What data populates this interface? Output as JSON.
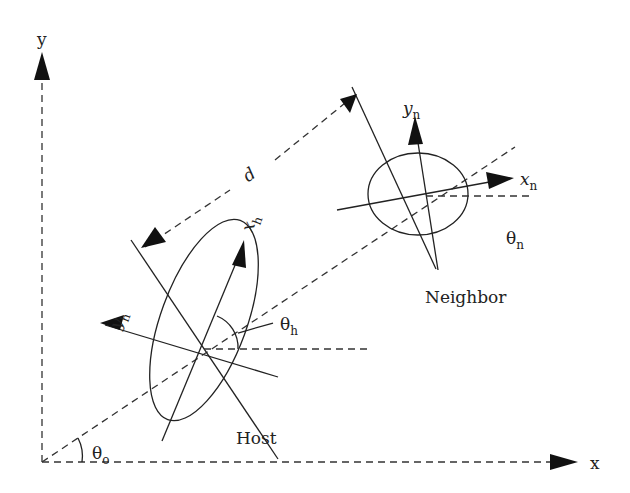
{
  "diagram": {
    "title": "",
    "colors": {
      "stroke": "#2a2a2a",
      "background": "#ffffff"
    },
    "axes": {
      "x_label": "x",
      "y_label": "y",
      "origin_angle_label": "θ",
      "origin_angle_sub": "o"
    },
    "distance_label": "d",
    "host": {
      "name": "Host",
      "x_axis_label": "x",
      "x_axis_sub": "h",
      "y_axis_label": "y",
      "y_axis_sub": "h",
      "angle_label": "θ",
      "angle_sub": "h"
    },
    "neighbor": {
      "name": "Neighbor",
      "x_axis_label": "x",
      "x_axis_sub": "n",
      "y_axis_label": "y",
      "y_axis_sub": "n",
      "angle_label": "θ",
      "angle_sub": "n"
    }
  }
}
